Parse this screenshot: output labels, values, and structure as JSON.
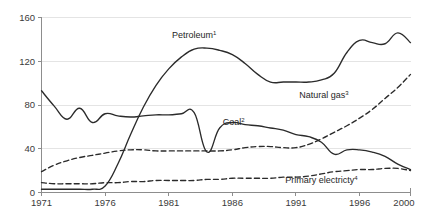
{
  "chart_data": {
    "type": "line",
    "title": "",
    "xlabel": "",
    "ylabel": "",
    "xlim": [
      1971,
      2000
    ],
    "ylim": [
      0,
      160
    ],
    "grid": "horizontal",
    "legend_position": "inline-labels",
    "ytick_labels": [
      "0",
      "40",
      "80",
      "120",
      "160"
    ],
    "ytick_values": [
      0,
      40,
      80,
      120,
      160
    ],
    "xtick_labels": [
      "1971",
      "1976",
      "1981",
      "1986",
      "1991",
      "1996",
      "2000"
    ],
    "xtick_values": [
      1971,
      1976,
      1981,
      1986,
      1991,
      1996,
      2000
    ],
    "x": [
      1971,
      1972,
      1973,
      1974,
      1975,
      1976,
      1977,
      1978,
      1979,
      1980,
      1981,
      1982,
      1983,
      1984,
      1985,
      1986,
      1987,
      1988,
      1989,
      1990,
      1991,
      1992,
      1993,
      1994,
      1995,
      1996,
      1997,
      1998,
      1999,
      2000
    ],
    "series": [
      {
        "name": "Petroleum",
        "footnote": "1",
        "style": "solid",
        "color": "#2b2b2b",
        "label_x": 1983.0,
        "label_y": 141,
        "values": [
          3,
          3,
          3,
          3,
          3,
          6,
          26,
          53,
          78,
          98,
          113,
          124,
          131,
          132,
          130,
          126,
          118,
          108,
          101,
          101,
          101,
          101,
          103,
          109,
          128,
          139,
          137,
          136,
          146,
          137
        ]
      },
      {
        "name": "Coal",
        "footnote": "2",
        "style": "solid",
        "color": "#2b2b2b",
        "label_x": 1986.1,
        "label_y": 62,
        "values": [
          93,
          79,
          67,
          77,
          64,
          72,
          70,
          69,
          70,
          71,
          71,
          72,
          73,
          37,
          59,
          64,
          62,
          61,
          59,
          57,
          53,
          51,
          46,
          35,
          39,
          39,
          37,
          33,
          26,
          21
        ]
      },
      {
        "name": "Natural gas",
        "footnote": "3",
        "style": "dashed",
        "color": "#2b2b2b",
        "label_x": 1993.2,
        "label_y": 86,
        "values": [
          19,
          25,
          29,
          32,
          34,
          36,
          38,
          39,
          39,
          38,
          38,
          38,
          38,
          38,
          38,
          39,
          41,
          42,
          42,
          41,
          41,
          44,
          49,
          55,
          61,
          68,
          76,
          86,
          96,
          108
        ]
      },
      {
        "name": "Primary electricty",
        "footnote": "4",
        "style": "dashed",
        "color": "#2b2b2b",
        "label_x": 1993.0,
        "label_y": 9,
        "values": [
          9,
          8,
          8,
          8,
          8,
          9,
          9,
          10,
          10,
          11,
          11,
          11,
          11,
          12,
          12,
          13,
          13,
          13,
          13,
          14,
          14,
          15,
          17,
          19,
          20,
          21,
          21,
          22,
          22,
          20
        ]
      }
    ]
  }
}
